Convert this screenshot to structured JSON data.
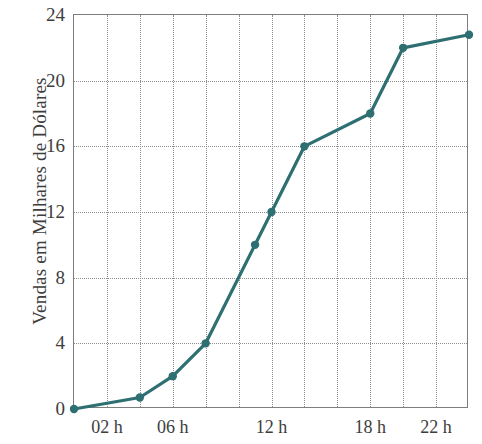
{
  "chart_data": {
    "type": "line",
    "title": "",
    "xlabel": "",
    "ylabel": "Vendas em Milhares de Dólares",
    "xlim": [
      0,
      24
    ],
    "ylim": [
      0,
      24
    ],
    "grid": true,
    "legend": null,
    "line_color": "#2e6f72",
    "marker_color": "#2e6f72",
    "axis_color": "#7d7d7d",
    "grid_color": "#8d8d8d",
    "background_color": "#ffffff",
    "x_tick_values": [
      0,
      2,
      4,
      6,
      8,
      10,
      12,
      14,
      16,
      18,
      20,
      22,
      24
    ],
    "x_tick_labels": [
      {
        "value": 2,
        "label": "02 h"
      },
      {
        "value": 6,
        "label": "06 h"
      },
      {
        "value": 12,
        "label": "12 h"
      },
      {
        "value": 18,
        "label": "18 h"
      },
      {
        "value": 22,
        "label": "22 h"
      }
    ],
    "y_tick_values": [
      0,
      4,
      8,
      12,
      16,
      20,
      24
    ],
    "y_tick_labels": [
      "0",
      "4",
      "8",
      "12",
      "16",
      "20",
      "24"
    ],
    "x": [
      0,
      4,
      6,
      8,
      11,
      12,
      14,
      18,
      20,
      24
    ],
    "y": [
      0,
      0.7,
      2,
      4,
      10,
      12,
      16,
      18,
      22,
      22.8
    ],
    "points": [
      {
        "x": 0,
        "y": 0
      },
      {
        "x": 4,
        "y": 0.7
      },
      {
        "x": 6,
        "y": 2
      },
      {
        "x": 8,
        "y": 4
      },
      {
        "x": 11,
        "y": 10
      },
      {
        "x": 12,
        "y": 12
      },
      {
        "x": 14,
        "y": 16
      },
      {
        "x": 18,
        "y": 18
      },
      {
        "x": 20,
        "y": 22
      },
      {
        "x": 24,
        "y": 22.8
      }
    ]
  }
}
